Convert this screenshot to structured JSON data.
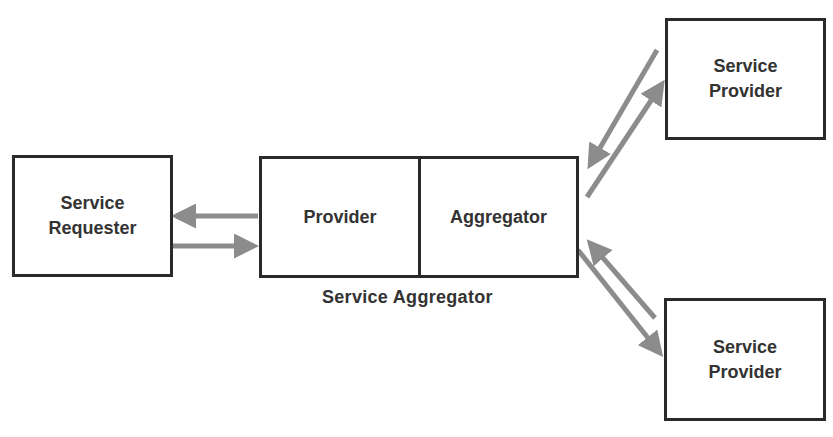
{
  "diagram": {
    "requester": {
      "label": "Service\nRequester"
    },
    "aggregator": {
      "caption": "Service Aggregator",
      "left_label": "Provider",
      "right_label": "Aggregator"
    },
    "provider_top": {
      "label": "Service\nProvider"
    },
    "provider_bottom": {
      "label": "Service\nProvider"
    },
    "colors": {
      "box_border": "#2a2a2a",
      "arrow": "#8c8c8c",
      "text": "#333333"
    }
  }
}
